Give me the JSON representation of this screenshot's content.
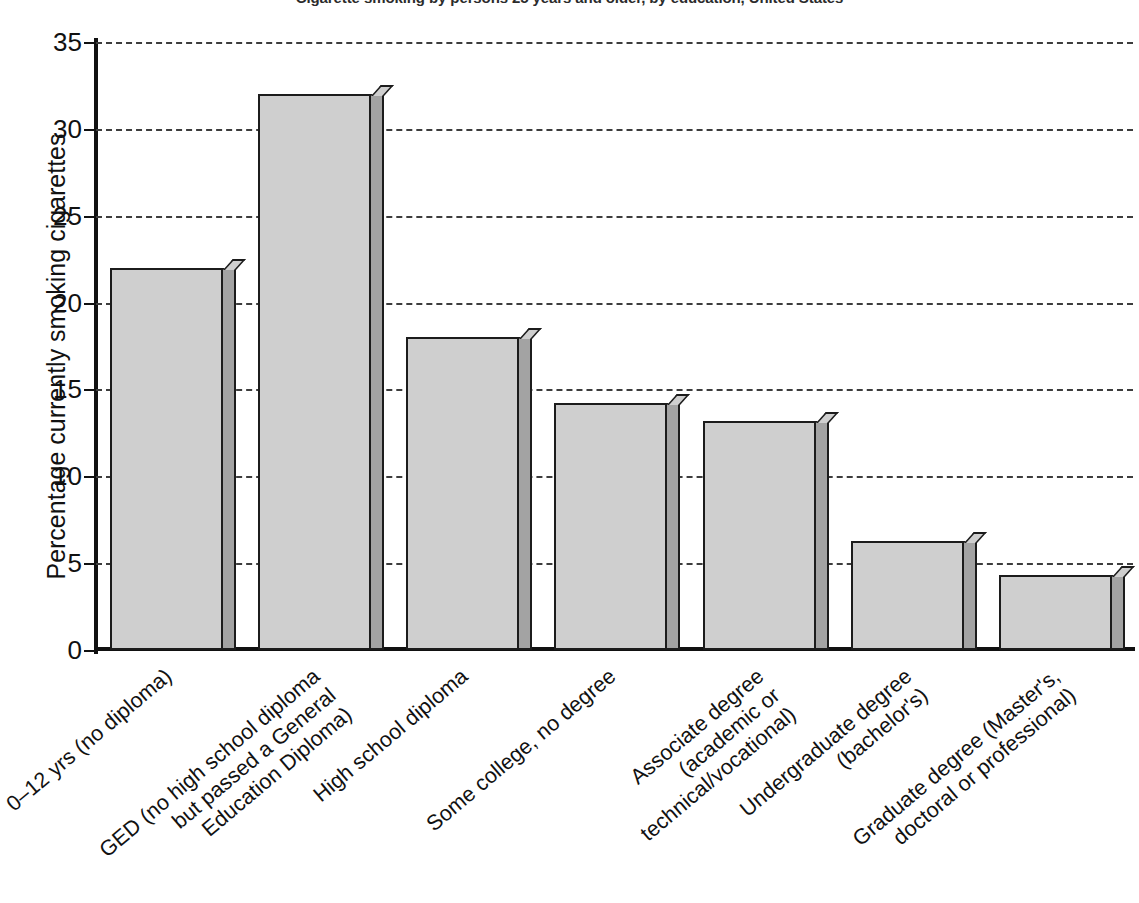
{
  "chart_data": {
    "type": "bar",
    "title": "Cigarette smoking by persons 25 years and older, by education, United States",
    "xlabel": "",
    "ylabel": "Percentage currently smoking cigarettes",
    "ylim": [
      0,
      35
    ],
    "yticks": [
      "0",
      "5",
      "10",
      "15",
      "20",
      "25",
      "30",
      "35"
    ],
    "grid": true,
    "legend": "none",
    "categories": [
      "0–12 yrs (no diploma)",
      "GED (no high school diploma\nbut passed a General\nEducation Diploma)",
      "High school diploma",
      "Some college, no degree",
      "Associate degree\n(academic or\ntechnical/vocational)",
      "Undergraduate degree\n(bachelor's)",
      "Graduate degree (Master's,\ndoctoral or professional)"
    ],
    "values": [
      22.0,
      32.0,
      18.0,
      14.2,
      13.2,
      6.3,
      4.3
    ],
    "bar_color": "#cfcfcf",
    "bar_edge_color": "#1c1c1c",
    "bar_side_color": "#a3a3a3",
    "gridline_color": "#3d3d3d",
    "axis_color": "#111111"
  }
}
